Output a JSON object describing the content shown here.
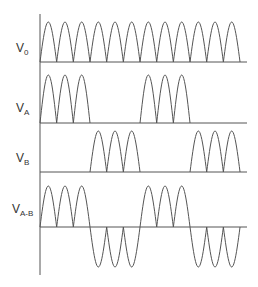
{
  "diagram": {
    "line_color": "#555555",
    "axis": {
      "x": 40,
      "top": 14,
      "bottom": 275
    },
    "x_start": 40,
    "x_end": 247,
    "period": 16.67,
    "hump_count": 12,
    "rows": [
      {
        "id": "v0",
        "label": "V",
        "subscript": "0",
        "label_x": 16,
        "label_y": 42,
        "baseline": 62,
        "peak": 22,
        "pattern": [
          1,
          1,
          1,
          1,
          1,
          1,
          1,
          1,
          1,
          1,
          1,
          1
        ]
      },
      {
        "id": "va",
        "label": "V",
        "subscript": "A",
        "label_x": 16,
        "label_y": 102,
        "baseline": 123,
        "peak": 75,
        "pattern": [
          1,
          1,
          1,
          0,
          0,
          0,
          1,
          1,
          1,
          0,
          0,
          0
        ]
      },
      {
        "id": "vb",
        "label": "V",
        "subscript": "B",
        "label_x": 16,
        "label_y": 152,
        "baseline": 172,
        "peak": 131,
        "pattern": [
          0,
          0,
          0,
          1,
          1,
          1,
          0,
          0,
          0,
          1,
          1,
          1
        ]
      },
      {
        "id": "vab",
        "label": "V",
        "subscript": "A-B",
        "label_x": 12,
        "label_y": 203,
        "baseline": 227,
        "peak": 186,
        "trough": 267,
        "pattern": [
          1,
          1,
          1,
          -1,
          -1,
          -1,
          1,
          1,
          1,
          -1,
          -1,
          -1
        ]
      }
    ]
  }
}
